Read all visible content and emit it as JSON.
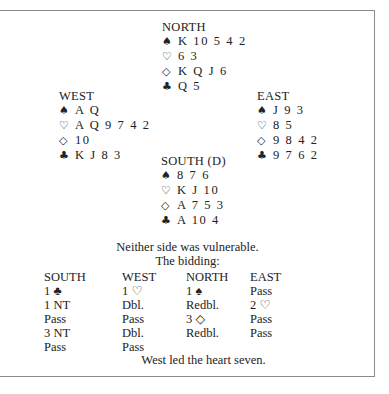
{
  "deal": {
    "north": {
      "label": "NORTH",
      "spades": "K 10 5 4 2",
      "hearts": "6 3",
      "diamonds": "K Q J 6",
      "clubs": "Q 5"
    },
    "west": {
      "label": "WEST",
      "spades": "A Q",
      "hearts": "A Q 9 7 4 2",
      "diamonds": "10",
      "clubs": "K J 8 3"
    },
    "east": {
      "label": "EAST",
      "spades": "J 9 3",
      "hearts": "8 5",
      "diamonds": "9 8 4 2",
      "clubs": "9 7 6 2"
    },
    "south": {
      "label": "SOUTH (D)",
      "spades": "8 7 6",
      "hearts": "K J 10",
      "diamonds": "A 7 5 3",
      "clubs": "A 10 4"
    }
  },
  "icons": {
    "spade": "♠",
    "heart": "♡",
    "diamond": "◇",
    "club": "♣"
  },
  "vulnerability": "Neither side was vulnerable.",
  "bidding_label": "The bidding:",
  "bidding": {
    "headers": [
      "SOUTH",
      "WEST",
      "NORTH",
      "EAST"
    ],
    "south": [
      "1 ♣",
      "1 NT",
      "Pass",
      "3 NT",
      "Pass"
    ],
    "west": [
      "1 ♡",
      "Dbl.",
      "Pass",
      "Dbl.",
      "Pass"
    ],
    "north": [
      "1 ♠",
      "Redbl.",
      "3 ◇",
      "Redbl."
    ],
    "east": [
      "Pass",
      "2 ♡",
      "Pass",
      "Pass"
    ]
  },
  "lead": "West led the heart seven."
}
